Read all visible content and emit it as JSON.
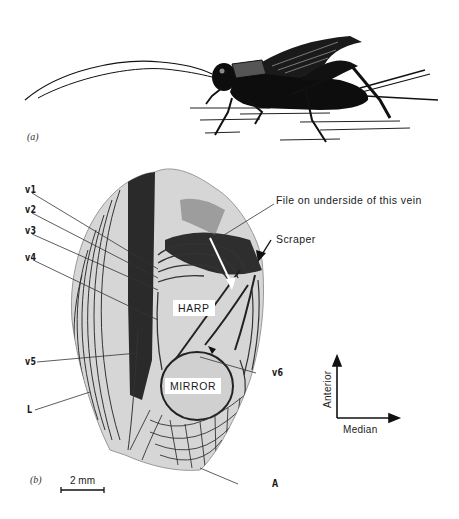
{
  "figure": {
    "panel_a": {
      "label": "(a)",
      "subject": "cricket-side-view"
    },
    "panel_b": {
      "label": "(b)",
      "subject": "cricket-forewing",
      "vein_labels": [
        "v1",
        "v2",
        "v3",
        "v4",
        "v5",
        "v6",
        "L",
        "A"
      ],
      "callouts": {
        "file": "File on underside of this vein",
        "scraper": "Scraper"
      },
      "regions": {
        "harp": "HARP",
        "mirror": "MIRROR"
      },
      "orientation": {
        "vertical": "Anterior",
        "horizontal": "Median"
      },
      "scale_bar": "2 mm"
    }
  },
  "colors": {
    "ink": "#1a1a1a",
    "wing_fill": "#d9d9d9",
    "wing_dark": "#3a3a3a"
  }
}
